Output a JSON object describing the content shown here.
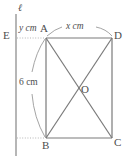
{
  "figure": {
    "stroke_color": "#7a7a7a",
    "dotted_color": "#b0b0b0",
    "text_color": "#4d4d4d",
    "background": "#ffffff",
    "line_label": "ℓ",
    "vertices": [
      {
        "name": "A",
        "label": "A",
        "x": 46,
        "y": 38
      },
      {
        "name": "B",
        "label": "B",
        "x": 46,
        "y": 138
      },
      {
        "name": "C",
        "label": "C",
        "x": 112,
        "y": 138
      },
      {
        "name": "D",
        "label": "D",
        "x": 112,
        "y": 38
      },
      {
        "name": "O",
        "label": "O",
        "x": 79,
        "y": 88
      },
      {
        "name": "E",
        "label": "E",
        "x": 16,
        "y": 38
      }
    ],
    "dimensions": [
      {
        "name": "top-width",
        "value": "x",
        "unit": "cm",
        "text": "x cm"
      },
      {
        "name": "left-offset",
        "value": "y",
        "unit": "cm",
        "text": "y cm"
      },
      {
        "name": "side-height",
        "value": "6",
        "unit": "cm",
        "text": "6 cm"
      }
    ],
    "labels": {
      "x_cm": "x cm",
      "y_cm": "y cm",
      "six_cm": "6 cm",
      "vertex_a": "A",
      "vertex_b": "B",
      "vertex_c": "C",
      "vertex_d": "D",
      "vertex_o": "O",
      "vertex_e": "E",
      "line_l": "ℓ"
    }
  }
}
